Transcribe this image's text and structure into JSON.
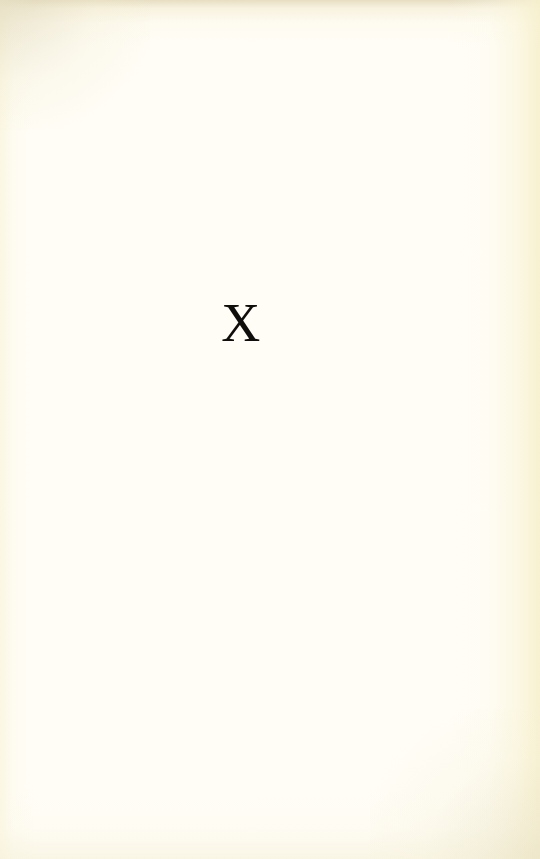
{
  "document": {
    "type": "scanned-book-page",
    "page_kind": "chapter-opening",
    "content_note": "blank page bearing only a chapter numeral",
    "page_number": "",
    "header": "",
    "footer": "",
    "body_text": ""
  },
  "chapter": {
    "numeral": "X",
    "numeral_system": "roman",
    "numeral_value": "10",
    "title": ""
  },
  "colors": {
    "paper": "#fffdf6",
    "ink": "#100e0c",
    "edge_cream": "#f7f0ce",
    "edge_tan": "#e2d8ba"
  }
}
